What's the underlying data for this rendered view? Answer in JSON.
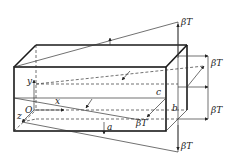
{
  "diagram": {
    "type": "3d-box-with-thermal-stress-distribution",
    "labels": {
      "axis_x": "x",
      "axis_y": "y",
      "axis_z": "z",
      "origin": "O",
      "dim_a": "a",
      "dim_b": "b",
      "dim_c": "c",
      "stress_top": "βT",
      "stress_right_upper": "βT",
      "stress_right_lower": "βT",
      "stress_bottom": "βT",
      "stress_front": "βT"
    },
    "colors": {
      "line": "#1a1a1a",
      "background": "#ffffff"
    }
  }
}
